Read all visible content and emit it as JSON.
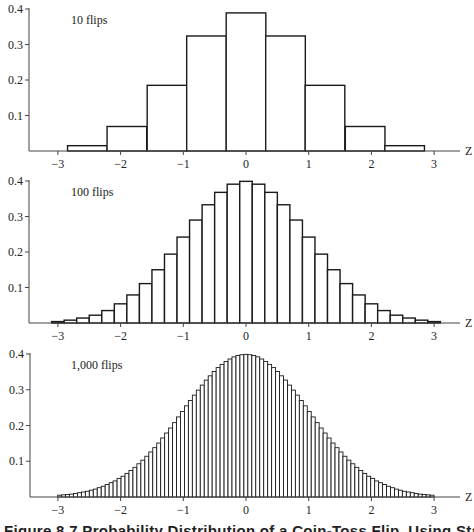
{
  "figure": {
    "caption": "Figure 8.7  Probability Distribution of a Coin-Toss Flip, Using Standardized Z"
  },
  "chart_data": [
    {
      "type": "bar",
      "title": "10 flips",
      "xlabel": "Z",
      "ylabel": "",
      "xlim": [
        -3.4,
        3.4
      ],
      "ylim": [
        0,
        0.4
      ],
      "xticks": [
        "−3",
        "−2",
        "−1",
        "0",
        "1",
        "2",
        "3"
      ],
      "yticks": [
        "0.1",
        "0.2",
        "0.3",
        "0.4"
      ],
      "grid": false,
      "bin_width": 0.632,
      "x": [
        -2.53,
        -1.9,
        -1.26,
        -0.63,
        0.0,
        0.63,
        1.26,
        1.9,
        2.53
      ],
      "values": [
        0.015,
        0.069,
        0.185,
        0.324,
        0.389,
        0.324,
        0.185,
        0.069,
        0.015
      ]
    },
    {
      "type": "bar",
      "title": "100 flips",
      "xlabel": "Z",
      "ylabel": "",
      "xlim": [
        -3.4,
        3.4
      ],
      "ylim": [
        0,
        0.4
      ],
      "xticks": [
        "−3",
        "−2",
        "−1",
        "0",
        "1",
        "2",
        "3"
      ],
      "yticks": [
        "0.1",
        "0.2",
        "0.3",
        "0.4"
      ],
      "grid": false,
      "bin_width": 0.2,
      "x": [
        -3.0,
        -2.8,
        -2.6,
        -2.4,
        -2.2,
        -2.0,
        -1.8,
        -1.6,
        -1.4,
        -1.2,
        -1.0,
        -0.8,
        -0.6,
        -0.4,
        -0.2,
        0.0,
        0.2,
        0.4,
        0.6,
        0.8,
        1.0,
        1.2,
        1.4,
        1.6,
        1.8,
        2.0,
        2.2,
        2.4,
        2.6,
        2.8,
        3.0
      ],
      "values": [
        0.004,
        0.008,
        0.014,
        0.022,
        0.035,
        0.054,
        0.079,
        0.111,
        0.15,
        0.194,
        0.242,
        0.29,
        0.333,
        0.368,
        0.391,
        0.399,
        0.391,
        0.368,
        0.333,
        0.29,
        0.242,
        0.194,
        0.15,
        0.111,
        0.079,
        0.054,
        0.035,
        0.022,
        0.014,
        0.008,
        0.004
      ]
    },
    {
      "type": "bar",
      "title": "1,000 flips",
      "xlabel": "Z",
      "ylabel": "",
      "xlim": [
        -3.4,
        3.4
      ],
      "ylim": [
        0,
        0.4
      ],
      "xticks": [
        "−3",
        "−2",
        "−1",
        "0",
        "1",
        "2",
        "3"
      ],
      "yticks": [
        "0.1",
        "0.2",
        "0.3",
        "0.4"
      ],
      "grid": false,
      "bin_width": 0.0632,
      "x_start": -2.9725,
      "values": [
        0.005,
        0.006,
        0.007,
        0.008,
        0.01,
        0.012,
        0.014,
        0.016,
        0.019,
        0.022,
        0.026,
        0.03,
        0.035,
        0.04,
        0.045,
        0.052,
        0.058,
        0.066,
        0.074,
        0.083,
        0.093,
        0.103,
        0.114,
        0.126,
        0.138,
        0.151,
        0.165,
        0.179,
        0.193,
        0.208,
        0.224,
        0.239,
        0.255,
        0.27,
        0.285,
        0.299,
        0.313,
        0.327,
        0.339,
        0.351,
        0.362,
        0.371,
        0.379,
        0.386,
        0.392,
        0.396,
        0.398,
        0.399,
        0.398,
        0.396,
        0.392,
        0.386,
        0.379,
        0.371,
        0.362,
        0.351,
        0.339,
        0.327,
        0.313,
        0.299,
        0.285,
        0.27,
        0.255,
        0.239,
        0.224,
        0.208,
        0.193,
        0.179,
        0.165,
        0.151,
        0.138,
        0.126,
        0.114,
        0.103,
        0.093,
        0.083,
        0.074,
        0.066,
        0.058,
        0.052,
        0.045,
        0.04,
        0.035,
        0.03,
        0.026,
        0.022,
        0.019,
        0.016,
        0.014,
        0.012,
        0.01,
        0.008,
        0.007,
        0.006,
        0.005
      ]
    }
  ],
  "layout": {
    "panels": [
      {
        "top": 0,
        "axis_x": 29,
        "y_top": 9,
        "y_base": 151
      },
      {
        "top": 0,
        "axis_x": 29,
        "y_top": 181,
        "y_base": 323
      },
      {
        "top": 0,
        "axis_x": 30,
        "y_top": 354,
        "y_base": 497
      }
    ],
    "x_zero": 246,
    "x_unit": 62.7,
    "axis_right": 460,
    "colors": {
      "stroke": "#1a1a1a",
      "fill": "#ffffff",
      "axis": "#444444"
    }
  }
}
